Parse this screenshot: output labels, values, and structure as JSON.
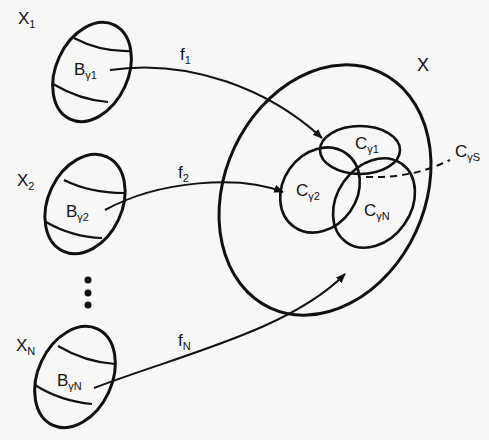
{
  "diagram": {
    "colors": {
      "stroke": "#111111",
      "background": "#f7f7f5"
    },
    "sources": [
      {
        "set": "X",
        "set_sub": "1",
        "block": "B",
        "block_sub": "γ1",
        "map": "f",
        "map_sub": "1"
      },
      {
        "set": "X",
        "set_sub": "2",
        "block": "B",
        "block_sub": "γ2",
        "map": "f",
        "map_sub": "2"
      },
      {
        "set": "X",
        "set_sub": "N",
        "block": "B",
        "block_sub": "γN",
        "map": "f",
        "map_sub": "N"
      }
    ],
    "ellipsis": "⋮",
    "target": {
      "set": "X",
      "regions": [
        {
          "label": "C",
          "sub": "γ1"
        },
        {
          "label": "C",
          "sub": "γ2"
        },
        {
          "label": "C",
          "sub": "γN"
        }
      ],
      "intersection": {
        "label": "C",
        "sub": "γS"
      }
    }
  }
}
